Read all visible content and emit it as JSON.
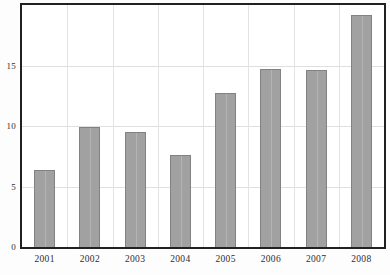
{
  "chart_data": {
    "type": "bar",
    "title": "",
    "subtitle": "",
    "xlabel": "",
    "ylabel": "",
    "categories": [
      "2001",
      "2002",
      "2003",
      "2004",
      "2005",
      "2006",
      "2007",
      "2008"
    ],
    "values": [
      6.4,
      9.9,
      9.5,
      7.6,
      12.7,
      14.7,
      14.6,
      19.2
    ],
    "series": [
      {
        "name": "",
        "values": [
          6.4,
          9.9,
          9.5,
          7.6,
          12.7,
          14.7,
          14.6,
          19.2
        ]
      }
    ],
    "ylim": [
      0,
      20
    ],
    "xlim": [
      0,
      8
    ],
    "yticks": [
      0,
      5,
      10,
      15
    ],
    "ytick_labels": [
      "0",
      "5",
      "10",
      "15"
    ],
    "grid": "both",
    "legend": "none",
    "bar_color": "#9c9c9c",
    "bar_edge_color": "#7c7c7c",
    "grid_color": "#dededd",
    "frame_color": "#15161a",
    "background_color": "#ffffff",
    "text_color": "#1b1c1f"
  },
  "axes": {
    "y": {
      "ticks": [
        {
          "label": "15",
          "value": 15
        },
        {
          "label": "10",
          "value": 10
        },
        {
          "label": "5",
          "value": 5
        },
        {
          "label": "0",
          "value": 0
        }
      ]
    },
    "x": {
      "ticks": [
        {
          "label": "2001"
        },
        {
          "label": "2002"
        },
        {
          "label": "2003"
        },
        {
          "label": "2004"
        },
        {
          "label": "2005"
        },
        {
          "label": "2006"
        },
        {
          "label": "2007"
        },
        {
          "label": "2008"
        }
      ]
    }
  }
}
